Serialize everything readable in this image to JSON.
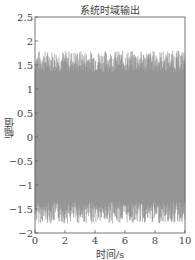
{
  "chart_data": {
    "type": "line",
    "title": "系统时域输出",
    "xlabel": "时间/s",
    "ylabel": "幅值",
    "xlim": [
      0,
      10
    ],
    "ylim": [
      -2,
      2.5
    ],
    "xticks": [
      0,
      2,
      4,
      6,
      8,
      10
    ],
    "yticks": [
      -2,
      -1.5,
      -1,
      -0.5,
      0,
      0.5,
      1,
      1.5,
      2,
      2.5
    ],
    "xtick_labels": [
      "0",
      "2",
      "4",
      "6",
      "8",
      "10"
    ],
    "ytick_labels": [
      "-2",
      "-1.5",
      "-1",
      "-0.5",
      "0",
      "0.5",
      "1",
      "1.5",
      "2",
      "2.5"
    ],
    "grid": false,
    "legend": null,
    "series": [
      {
        "name": "系统输出",
        "description": "dense high-frequency oscillation over 0–10 s, amplitude roughly between -1.8 and 1.8",
        "approx_max": 1.8,
        "approx_min": -1.8,
        "x_range": [
          0,
          10
        ]
      }
    ]
  }
}
